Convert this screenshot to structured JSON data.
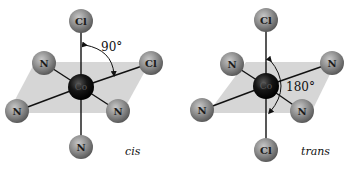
{
  "figure": {
    "panels": [
      {
        "name": "cis",
        "isomer_label": "cis",
        "angle_label": "90°",
        "center_atom": "Co",
        "atoms": [
          {
            "symbol": "Cl",
            "position": "top"
          },
          {
            "symbol": "Cl",
            "position": "right"
          },
          {
            "symbol": "N",
            "position": "upper-left"
          },
          {
            "symbol": "N",
            "position": "lower-left"
          },
          {
            "symbol": "N",
            "position": "lower-right"
          },
          {
            "symbol": "N",
            "position": "bottom"
          }
        ]
      },
      {
        "name": "trans",
        "isomer_label": "trans",
        "angle_label": "180°",
        "center_atom": "Co",
        "atoms": [
          {
            "symbol": "Cl",
            "position": "top"
          },
          {
            "symbol": "N",
            "position": "right"
          },
          {
            "symbol": "N",
            "position": "upper-left"
          },
          {
            "symbol": "N",
            "position": "lower-left"
          },
          {
            "symbol": "N",
            "position": "lower-right"
          },
          {
            "symbol": "Cl",
            "position": "bottom"
          }
        ]
      }
    ],
    "colors": {
      "plane": "#d4d4d4",
      "ligand_atom": "#8a8a8a",
      "center_atom": "#111111",
      "bond": "#111111"
    }
  }
}
